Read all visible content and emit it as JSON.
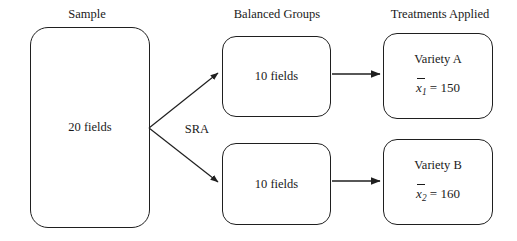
{
  "diagram": {
    "title_headers": {
      "sample": "Sample",
      "balanced_groups": "Balanced Groups",
      "treatments_applied": "Treatments Applied"
    },
    "sample_box": {
      "label": "20 fields"
    },
    "groups": [
      {
        "label": "10 fields"
      },
      {
        "label": "10 fields"
      }
    ],
    "treatments": [
      {
        "name": "Variety A",
        "mean_symbol": "x",
        "mean_subscript": "1",
        "mean_equals": "=",
        "mean_value": "150"
      },
      {
        "name": "Variety B",
        "mean_symbol": "x",
        "mean_subscript": "2",
        "mean_equals": "=",
        "mean_value": "160"
      }
    ],
    "assignment_label": "SRA",
    "colors": {
      "background": "#ffffff",
      "stroke": "#1f1f1f",
      "text": "#1a1a1a"
    }
  }
}
